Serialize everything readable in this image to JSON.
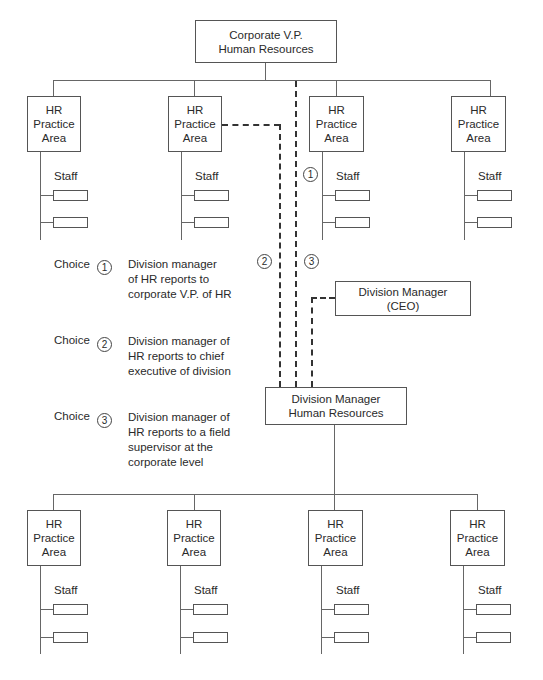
{
  "top_box": {
    "line1": "Corporate V.P.",
    "line2": "Human Resources"
  },
  "practice_area": {
    "line1": "HR",
    "line2": "Practice",
    "line3": "Area"
  },
  "staff_label": "Staff",
  "ceo_box": {
    "line1": "Division Manager",
    "line2": "(CEO)"
  },
  "division_hr_box": {
    "line1": "Division Manager",
    "line2": "Human Resources"
  },
  "markers": {
    "one": "1",
    "two": "2",
    "three": "3"
  },
  "choices": [
    {
      "label": "Choice",
      "number": "1",
      "desc_lines": [
        "Division manager",
        "of HR reports to",
        "corporate V.P. of HR"
      ]
    },
    {
      "label": "Choice",
      "number": "2",
      "desc_lines": [
        "Division manager of",
        "HR reports to chief",
        "executive of division"
      ]
    },
    {
      "label": "Choice",
      "number": "3",
      "desc_lines": [
        "Division manager of",
        "HR reports to a field",
        "supervisor at the",
        "corporate level"
      ]
    }
  ]
}
